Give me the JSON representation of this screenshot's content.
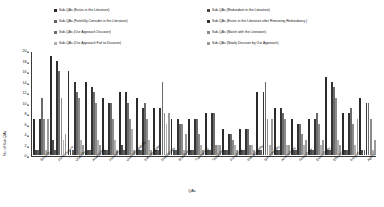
{
  "chart_data": {
    "type": "bar",
    "title": "",
    "xlabel": "QAs",
    "ylabel": "No. of Sub-QAs",
    "ylim": [
      0,
      20
    ],
    "ytick_step": 2,
    "yticks": [
      0,
      2,
      4,
      6,
      8,
      10,
      12,
      14,
      16,
      18,
      20
    ],
    "grid": false,
    "legend_position": "top",
    "orientation": "vertical",
    "bar_style": "grouped",
    "categories": [
      "Security",
      "Performance",
      "Usability",
      "Availability",
      "Flexibility",
      "Understandability",
      "Maintainability",
      "Modifiability",
      "Scalability",
      "Traceability",
      "Testability",
      "Portability",
      "Manageability",
      "Serviceability",
      "Accessibility",
      "Reusability",
      "Extensibility",
      "Efficiency",
      "Integrity",
      "Agility"
    ],
    "series": [
      {
        "name": "Sub-QAs (Exists in the Literature)",
        "color": "#2b2b2b",
        "values": [
          7,
          19,
          16,
          14,
          11,
          12,
          11,
          9,
          7,
          7,
          8,
          5,
          5,
          12,
          9,
          7,
          7,
          15,
          8,
          11
        ]
      },
      {
        "name": "Sub-QAs (Redundant in the Literature)",
        "color": "#4a4a4a",
        "values": [
          1,
          3,
          1,
          1,
          1,
          2,
          1,
          1,
          1,
          1,
          1,
          1,
          1,
          1,
          1,
          1,
          1,
          1,
          1,
          1
        ]
      },
      {
        "name": "Sub-QAs (Fatefully Consider in the Literature)",
        "color": "#5e5e5e",
        "values": [
          1,
          1,
          1,
          1,
          1,
          1,
          1,
          1,
          1,
          1,
          1,
          1,
          1,
          1,
          1,
          1,
          1,
          1,
          1,
          1
        ]
      },
      {
        "name": "Sub-QAs (Exists in the Literature after Removing Redundancy)",
        "color": "#333333",
        "values": [
          7,
          18,
          14,
          13,
          10,
          12,
          9,
          9,
          7,
          7,
          8,
          4,
          5,
          12,
          9,
          6,
          7,
          14,
          8,
          10
        ]
      },
      {
        "name": "Sub-QAs (Our Approach Discover)",
        "color": "#6b6b6b",
        "values": [
          11,
          16,
          12,
          12,
          10,
          10,
          10,
          14,
          6,
          7,
          8,
          4,
          5,
          14,
          8,
          6,
          8,
          13,
          9,
          10
        ]
      },
      {
        "name": "Sub-QAs (Match with the Literature)",
        "color": "#8a8a8a",
        "values": [
          7,
          11,
          11,
          10,
          7,
          7,
          7,
          8,
          6,
          4,
          2,
          3,
          2,
          7,
          7,
          4,
          6,
          11,
          6,
          7
        ]
      },
      {
        "name": "Sub-QAs (Our Approach Fail to Discover)",
        "color": "#b0b0b0",
        "values": [
          1,
          3,
          3,
          3,
          3,
          5,
          3,
          6,
          1,
          2,
          2,
          2,
          2,
          2,
          2,
          2,
          2,
          3,
          2,
          1
        ]
      },
      {
        "name": "Sub-QAs (Newly Discover by Our Approach)",
        "color": "#9a9a9a",
        "values": [
          7,
          4,
          2,
          2,
          1,
          1,
          1,
          8,
          4,
          1,
          2,
          1,
          1,
          7,
          2,
          3,
          3,
          2,
          7,
          3
        ]
      }
    ]
  },
  "legend": {
    "entries": [
      {
        "label": "Sub-QAs (Exists in the Literature)"
      },
      {
        "label": "Sub-QAs (Redundant in the Literature)"
      },
      {
        "label": "Sub-QAs (Fatefully Consider  in the Literature)"
      },
      {
        "label": "Sub-QAs (Exists in the Literature after Removing Redundancy )"
      },
      {
        "label": "Sub-QAs (Our Approach Discover)"
      },
      {
        "label": "Sub-QAs (Match with the Literature)"
      },
      {
        "label": "Sub-QAs (Our Approach Fail to Discover)"
      },
      {
        "label": "Sub-QAs (Newly Discover by Our Approach)"
      }
    ]
  }
}
